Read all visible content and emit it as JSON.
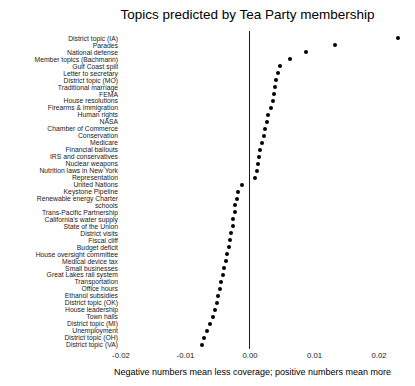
{
  "chart_data": {
    "type": "scatter",
    "title": "Topics predicted by Tea Party membership",
    "caption": "Negative numbers mean less coverage; positive numbers mean more",
    "xlabel": "",
    "ylabel": "",
    "xlim": [
      -0.025,
      0.0256
    ],
    "x_tick_labels": [
      "-0.02",
      "-0.01",
      "0.00",
      "0.01",
      "0.02"
    ],
    "x_tick_values": [
      -0.02,
      -0.01,
      0.0,
      0.01,
      0.02
    ],
    "zero_reference_line": true,
    "grid": false,
    "legend": false,
    "dot_color": "#000000",
    "categories": [
      "District topic (IA)",
      "Parades",
      "National defense",
      "Member topics (Bachmann)",
      "Gulf Coast spill",
      "Letter to secretary",
      "District topic (MO)",
      "Traditional marriage",
      "FEMA",
      "House resolutions",
      "Firearms & immigration",
      "Human rights",
      "NASA",
      "Chamber of Commerce",
      "Conservation",
      "Medicare",
      "Financial bailouts",
      "IRS and conservatives",
      "Nuclear weapons",
      "Nutrition laws in New York",
      "Representation",
      "United Nations",
      "Keystone Pipeline",
      "Renewable energy Charter",
      "schools",
      "Trans-Pacific Partnership",
      "California's water supply",
      "State of the Union",
      "District visits",
      "Fiscal cliff",
      "Budget deficit",
      "House oversight committee",
      "Medical device tax",
      "Small businesses",
      "Great Lakes rail system",
      "Transportation",
      "Office hours",
      "Ethanol subsidies",
      "District topic (OK)",
      "House leadership",
      "Town halls",
      "District topic (MI)",
      "Unemployment",
      "District topic (OH)",
      "District topic (VA)"
    ],
    "values": [
      0.023,
      0.0132,
      0.0087,
      0.0062,
      0.0046,
      0.0043,
      0.0041,
      0.0038,
      0.0037,
      0.0036,
      0.0033,
      0.0028,
      0.0026,
      0.0023,
      0.0021,
      0.0018,
      0.0016,
      0.0014,
      0.0013,
      0.0011,
      0.0008,
      -0.0013,
      -0.0018,
      -0.0021,
      -0.0023,
      -0.0024,
      -0.0026,
      -0.0027,
      -0.0029,
      -0.0031,
      -0.0032,
      -0.0035,
      -0.0037,
      -0.004,
      -0.0042,
      -0.0045,
      -0.0047,
      -0.005,
      -0.0052,
      -0.0055,
      -0.0058,
      -0.0062,
      -0.0066,
      -0.0071,
      -0.0074
    ]
  }
}
